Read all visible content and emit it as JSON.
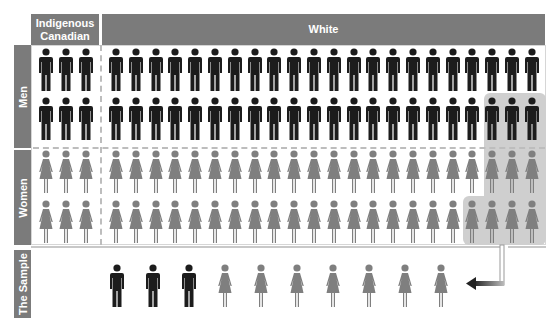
{
  "headers": {
    "indigenous": "Indigenous Canadian",
    "white": "White"
  },
  "row_labels": {
    "men": "Men",
    "women": "Women",
    "sample": "The Sample"
  },
  "population": {
    "indigenous_columns": 3,
    "white_columns": 22,
    "rows": [
      {
        "group": "men",
        "count_indigenous": 3,
        "count_white": 22
      },
      {
        "group": "men",
        "count_indigenous": 3,
        "count_white": 22
      },
      {
        "group": "women",
        "count_indigenous": 3,
        "count_white": 22
      },
      {
        "group": "women",
        "count_indigenous": 3,
        "count_white": 22
      }
    ]
  },
  "highlight": {
    "men_row2_last": 3,
    "women_row1_last": 3,
    "women_row2_last": 4
  },
  "sample": {
    "men": 3,
    "women": 7
  },
  "colors": {
    "header": "#7b7b7b",
    "men": "#1c1c1c",
    "women": "#7f7f7f",
    "highlight": "#cfcfcf"
  }
}
